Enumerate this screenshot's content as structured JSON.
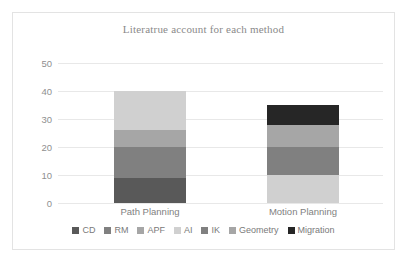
{
  "chart_data": {
    "type": "bar",
    "subtype": "stacked-bar",
    "title": "Literatrue account for each method",
    "xlabel": "",
    "ylabel": "",
    "ylim": [
      0,
      50
    ],
    "yticks": [
      0,
      10,
      20,
      30,
      40,
      50
    ],
    "ytick_labels": [
      "0",
      "10",
      "20",
      "30",
      "40",
      "50"
    ],
    "grid": true,
    "legend_position": "bottom",
    "categories": [
      "Path Planning",
      "Motion Planning"
    ],
    "series": [
      {
        "name": "CD",
        "color": "#595959",
        "values": [
          9,
          0
        ]
      },
      {
        "name": "RM",
        "color": "#808080",
        "values": [
          11,
          0
        ]
      },
      {
        "name": "APF",
        "color": "#a6a6a6",
        "values": [
          6,
          0
        ]
      },
      {
        "name": "AI",
        "color": "#d0d0d0",
        "values": [
          14,
          10
        ]
      },
      {
        "name": "IK",
        "color": "#808080",
        "values": [
          0,
          10
        ]
      },
      {
        "name": "Geometry",
        "color": "#a6a6a6",
        "values": [
          0,
          8
        ]
      },
      {
        "name": "Migration",
        "color": "#262626",
        "values": [
          0,
          7
        ]
      }
    ],
    "totals": [
      40,
      35
    ]
  },
  "colors": {
    "frame_border": "#e3e3e3",
    "gridline": "#e8e8e8",
    "title_text": "#8a8a8a",
    "tick_text": "#8f8f8f",
    "legend_text": "#7a7a7a"
  }
}
